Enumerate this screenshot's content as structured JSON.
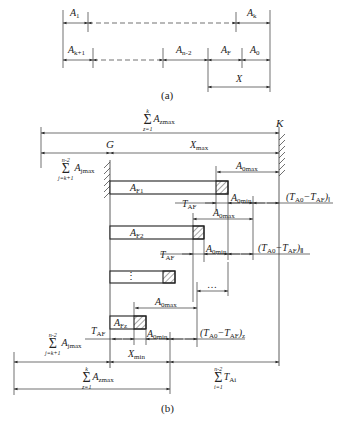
{
  "part_a": {
    "caption": "(a)",
    "row1": {
      "left": "A",
      "left_sub": "1",
      "right": "A",
      "right_sub": "k"
    },
    "row2": {
      "a": "A",
      "a_sub": "k+1",
      "b": "A",
      "b_sub": "n-2",
      "c": "A",
      "c_sub": "F",
      "d": "A",
      "d_sub": "0"
    },
    "x_label": "X"
  },
  "part_b": {
    "caption": "(b)",
    "wall_left": "G",
    "wall_right": "K",
    "top_sum": {
      "upper": "k",
      "lower": "z=1",
      "term": "A",
      "term_sub": "zmax"
    },
    "left_sum": {
      "upper": "n-2",
      "lower": "j=k+1",
      "term": "A",
      "term_sub": "jmax"
    },
    "xmax": {
      "t": "X",
      "sub": "max"
    },
    "xmin": {
      "t": "X",
      "sub": "min"
    },
    "a0max": {
      "t": "A",
      "sub": "0max"
    },
    "a0min": {
      "t": "A",
      "sub": "0min"
    },
    "taf": {
      "t": "T",
      "sub": "AF"
    },
    "boxes": [
      {
        "t": "A",
        "sub": "F1"
      },
      {
        "t": "A",
        "sub": "F2"
      },
      {
        "t": "⋮",
        "sub": ""
      },
      {
        "t": "A",
        "sub": "Fz"
      }
    ],
    "diff_labels": [
      {
        "t": "(T",
        "s1": "A0",
        "m": "−T",
        "s2": "AF",
        "e": ")",
        "idx": "Ⅰ"
      },
      {
        "t": "(T",
        "s1": "A0",
        "m": "−T",
        "s2": "AF",
        "e": ")",
        "idx": "Ⅱ"
      },
      {
        "t": "(T",
        "s1": "A0",
        "m": "−T",
        "s2": "AF",
        "e": ")",
        "idx": "z"
      }
    ],
    "ellipsis": "…",
    "bottom_sum": {
      "upper": "k",
      "lower": "z=1",
      "term": "A",
      "term_sub": "zmax"
    },
    "left_sum_bottom": {
      "upper": "n-2",
      "lower": "j=k+1",
      "term": "A",
      "term_sub": "jmax"
    },
    "right_sum_bottom": {
      "upper": "n-2",
      "lower": "i=1",
      "term": "T",
      "term_sub": "Ai"
    }
  }
}
